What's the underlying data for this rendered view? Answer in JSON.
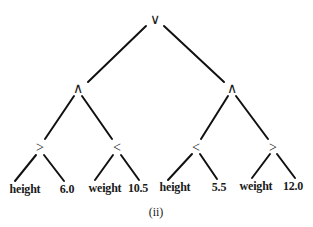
{
  "diagram": {
    "type": "expression-tree",
    "caption": "(ii)",
    "line_color": "#111111",
    "nodes": [
      {
        "id": "n0",
        "label": "∨",
        "x": 155,
        "y": 20,
        "kind": "operator",
        "meaning": "or"
      },
      {
        "id": "n1",
        "label": "∧",
        "x": 78,
        "y": 89,
        "kind": "operator",
        "meaning": "and"
      },
      {
        "id": "n2",
        "label": "∧",
        "x": 232,
        "y": 89,
        "kind": "operator",
        "meaning": "and"
      },
      {
        "id": "n3",
        "label": ">",
        "x": 40,
        "y": 148,
        "kind": "operator",
        "meaning": "greater-than"
      },
      {
        "id": "n4",
        "label": "<",
        "x": 117,
        "y": 148,
        "kind": "operator",
        "meaning": "less-than"
      },
      {
        "id": "n5",
        "label": "<",
        "x": 196,
        "y": 148,
        "kind": "operator",
        "meaning": "less-than"
      },
      {
        "id": "n6",
        "label": ">",
        "x": 273,
        "y": 148,
        "kind": "operator",
        "meaning": "greater-than"
      },
      {
        "id": "l0",
        "label": "height",
        "x": 25,
        "y": 189,
        "kind": "leaf"
      },
      {
        "id": "l1",
        "label": "6.0",
        "x": 67,
        "y": 189,
        "kind": "leaf"
      },
      {
        "id": "l2",
        "label": "weight",
        "x": 105,
        "y": 188,
        "kind": "leaf"
      },
      {
        "id": "l3",
        "label": "10.5",
        "x": 138,
        "y": 188,
        "kind": "leaf"
      },
      {
        "id": "l4",
        "label": "height",
        "x": 175,
        "y": 187,
        "kind": "leaf"
      },
      {
        "id": "l5",
        "label": "5.5",
        "x": 219,
        "y": 187,
        "kind": "leaf"
      },
      {
        "id": "l6",
        "label": "weight",
        "x": 256,
        "y": 186,
        "kind": "leaf"
      },
      {
        "id": "l7",
        "label": "12.0",
        "x": 293,
        "y": 186,
        "kind": "leaf"
      }
    ],
    "edges": [
      {
        "from": "n0",
        "to": "n1",
        "x1": 146,
        "y1": 26,
        "x2": 88,
        "y2": 82
      },
      {
        "from": "n0",
        "to": "n2",
        "x1": 164,
        "y1": 26,
        "x2": 224,
        "y2": 82
      },
      {
        "from": "n1",
        "to": "n3",
        "x1": 74,
        "y1": 96,
        "x2": 45,
        "y2": 139
      },
      {
        "from": "n1",
        "to": "n4",
        "x1": 82,
        "y1": 96,
        "x2": 112,
        "y2": 139
      },
      {
        "from": "n2",
        "to": "n5",
        "x1": 228,
        "y1": 96,
        "x2": 201,
        "y2": 139
      },
      {
        "from": "n2",
        "to": "n6",
        "x1": 236,
        "y1": 96,
        "x2": 268,
        "y2": 139
      },
      {
        "from": "n3",
        "to": "l0",
        "x1": 36,
        "y1": 155,
        "x2": 15,
        "y2": 181
      },
      {
        "from": "n3",
        "to": "l1",
        "x1": 44,
        "y1": 155,
        "x2": 64,
        "y2": 181
      },
      {
        "from": "n4",
        "to": "l2",
        "x1": 113,
        "y1": 155,
        "x2": 95,
        "y2": 180
      },
      {
        "from": "n4",
        "to": "l3",
        "x1": 121,
        "y1": 155,
        "x2": 139,
        "y2": 180
      },
      {
        "from": "n5",
        "to": "l4",
        "x1": 192,
        "y1": 154,
        "x2": 168,
        "y2": 180
      },
      {
        "from": "n5",
        "to": "l5",
        "x1": 200,
        "y1": 154,
        "x2": 217,
        "y2": 179
      },
      {
        "from": "n6",
        "to": "l6",
        "x1": 270,
        "y1": 154,
        "x2": 252,
        "y2": 178
      },
      {
        "from": "n6",
        "to": "l7",
        "x1": 277,
        "y1": 154,
        "x2": 295,
        "y2": 178
      }
    ]
  }
}
